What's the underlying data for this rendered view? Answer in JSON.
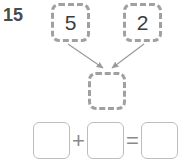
{
  "problem": {
    "number": "15",
    "number_bond": {
      "addend_1": "5",
      "addend_2": "2",
      "sum": "",
      "arrow_1_name": "arrow-from-addend-1-to-sum",
      "arrow_2_name": "arrow-from-addend-2-to-sum"
    },
    "equation": {
      "box_1_value": "",
      "plus_operator": "+",
      "box_2_value": "",
      "equals_operator": "=",
      "box_3_value": ""
    }
  },
  "colors": {
    "dashed_border": "#a0a0a0",
    "solid_border": "#bdbdbd",
    "digit_text": "#3d3d3d",
    "problem_number_text": "#4b4b4b",
    "operator_text": "#8a8a8a",
    "arrow_stroke": "#9a9a9a",
    "background": "#ffffff"
  }
}
